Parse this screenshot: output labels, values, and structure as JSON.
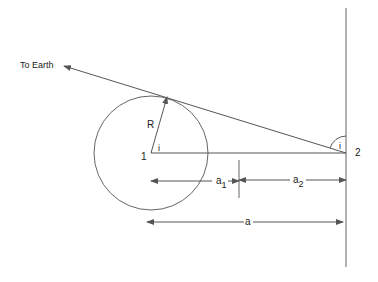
{
  "diagram": {
    "labels": {
      "to_earth": "To Earth",
      "radius": "R",
      "point1": "1",
      "point2": "2",
      "angle_at_1": "i",
      "angle_at_2": "i",
      "a1_base": "a",
      "a1_sub": "1",
      "a2_base": "a",
      "a2_sub": "2",
      "a": "a"
    },
    "colors": {
      "line": "#555555",
      "text": "#222222",
      "background": "#ffffff"
    }
  }
}
